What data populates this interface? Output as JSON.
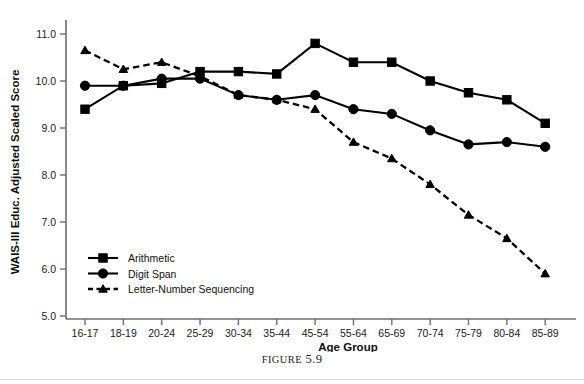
{
  "figure": {
    "caption_prefix": "FIGURE",
    "caption_number": "5.9"
  },
  "axes": {
    "ylabel": "WAIS-III Educ. Adjusted Scaled Score",
    "xlabel": "Age Group",
    "yticks": [
      "11.0",
      "10.0",
      "9.0",
      "8.0",
      "7.0",
      "6.0",
      "5.0"
    ]
  },
  "legend": {
    "items": [
      {
        "label": "Arithmetic",
        "marker": "square",
        "dash": false
      },
      {
        "label": "Digit Span",
        "marker": "circle",
        "dash": false
      },
      {
        "label": "Letter-Number Sequencing",
        "marker": "triangle",
        "dash": true
      }
    ]
  },
  "chart_data": {
    "type": "line",
    "title": "",
    "xlabel": "Age Group",
    "ylabel": "WAIS-III Educ. Adjusted Scaled Score",
    "ylim": [
      5.0,
      11.4
    ],
    "yticks": [
      5.0,
      6.0,
      7.0,
      8.0,
      9.0,
      10.0,
      11.0
    ],
    "grid": false,
    "legend_position": "lower-left-inside",
    "categories": [
      "16-17",
      "18-19",
      "20-24",
      "25-29",
      "30-34",
      "35-44",
      "45-54",
      "55-64",
      "65-69",
      "70-74",
      "75-79",
      "80-84",
      "85-89"
    ],
    "series": [
      {
        "name": "Arithmetic",
        "marker": "square",
        "dash": false,
        "values": [
          9.4,
          9.9,
          9.95,
          10.2,
          10.2,
          10.15,
          10.8,
          10.4,
          10.4,
          10.0,
          9.75,
          9.6,
          9.1
        ]
      },
      {
        "name": "Digit Span",
        "marker": "circle",
        "dash": false,
        "values": [
          9.9,
          9.9,
          10.05,
          10.05,
          9.7,
          9.6,
          9.7,
          9.4,
          9.3,
          8.95,
          8.65,
          8.7,
          8.6
        ]
      },
      {
        "name": "Letter-Number Sequencing",
        "marker": "triangle",
        "dash": true,
        "values": [
          10.65,
          10.25,
          10.4,
          10.1,
          9.7,
          9.6,
          9.4,
          8.7,
          8.35,
          7.8,
          7.15,
          6.65,
          5.9
        ]
      }
    ]
  }
}
